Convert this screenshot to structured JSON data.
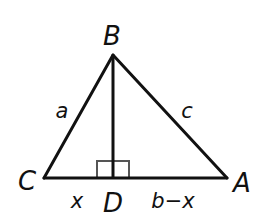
{
  "diagram": {
    "type": "triangle-with-altitude",
    "stroke_color": "#111111",
    "right_angle_color": "#555555",
    "vertices": {
      "B": {
        "label": "B",
        "x": 113,
        "y": 55
      },
      "C": {
        "label": "C",
        "x": 44,
        "y": 178
      },
      "A": {
        "label": "A",
        "x": 227,
        "y": 178
      },
      "D": {
        "label": "D",
        "x": 113,
        "y": 178
      }
    },
    "sides": {
      "BC": {
        "label": "a"
      },
      "BA": {
        "label": "c"
      },
      "CD": {
        "label": "x"
      },
      "DA": {
        "label": "b−x"
      }
    },
    "altitude": {
      "from": "B",
      "to": "D",
      "right_angle_marker": true
    }
  }
}
